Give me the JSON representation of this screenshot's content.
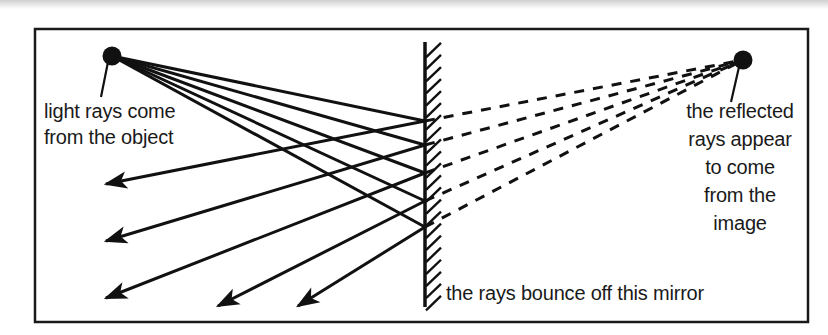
{
  "figure": {
    "frame": {
      "x": 35,
      "y": 29,
      "width": 773,
      "height": 293,
      "stroke": "#1a1a1a",
      "stroke_width": 2.5
    },
    "page_edge_band": {
      "visible": true,
      "height": 7,
      "color": "#d2d2d2"
    },
    "ink_color": "#111111",
    "background": "#ffffff"
  },
  "mirror": {
    "label": "the rays bounce off this mirror",
    "x": 425,
    "y_top": 42,
    "y_bottom": 307,
    "stroke_width": 3.5,
    "hatch_side": "right",
    "hatch_count": 22,
    "hatch_length": 16,
    "label_pos": {
      "x": 446,
      "y": 300
    }
  },
  "object": {
    "label": "light rays come\nfrom the object",
    "label_lines": [
      "light rays come",
      "from the object"
    ],
    "dot": {
      "cx": 112,
      "cy": 56,
      "r": 9.5
    },
    "leader": {
      "x1": 108,
      "y1": 62,
      "x2": 101,
      "y2": 97
    },
    "label_pos": {
      "x": 44,
      "y": 118
    },
    "label_anchor": "start",
    "line_height": 26
  },
  "image": {
    "label": "the reflected\nrays appear\nto come\nfrom the\nimage",
    "label_lines": [
      "the reflected",
      "rays appear",
      "to come",
      "from the",
      "image"
    ],
    "dot": {
      "cx": 743,
      "cy": 60,
      "r": 9.5
    },
    "leader": {
      "x1": 739,
      "y1": 67,
      "x2": 731,
      "y2": 102
    },
    "label_pos": {
      "x": 740,
      "y": 118
    },
    "label_anchor": "middle",
    "line_height": 28
  },
  "chart_data": {
    "type": "diagram",
    "object_point": {
      "x": 112,
      "y": 56
    },
    "image_point": {
      "x": 743,
      "y": 60
    },
    "mirror_x": 425,
    "incident_rays": [
      {
        "from": [
          112,
          56
        ],
        "to": [
          425,
          121
        ]
      },
      {
        "from": [
          112,
          56
        ],
        "to": [
          425,
          145
        ]
      },
      {
        "from": [
          112,
          56
        ],
        "to": [
          425,
          173
        ]
      },
      {
        "from": [
          112,
          56
        ],
        "to": [
          425,
          201
        ]
      },
      {
        "from": [
          112,
          56
        ],
        "to": [
          425,
          227
        ]
      }
    ],
    "reflected_rays": [
      {
        "from": [
          425,
          121
        ],
        "to": [
          106,
          184
        ],
        "arrow": true
      },
      {
        "from": [
          425,
          145
        ],
        "to": [
          106,
          241
        ],
        "arrow": true
      },
      {
        "from": [
          425,
          173
        ],
        "to": [
          106,
          298
        ],
        "arrow": true
      },
      {
        "from": [
          425,
          201
        ],
        "to": [
          218,
          306
        ],
        "arrow": true
      },
      {
        "from": [
          425,
          227
        ],
        "to": [
          298,
          306
        ],
        "arrow": true
      }
    ],
    "virtual_rays_dashed": [
      {
        "from": [
          425,
          121
        ],
        "to": [
          743,
          60
        ]
      },
      {
        "from": [
          425,
          145
        ],
        "to": [
          743,
          60
        ]
      },
      {
        "from": [
          425,
          173
        ],
        "to": [
          743,
          60
        ]
      },
      {
        "from": [
          425,
          201
        ],
        "to": [
          743,
          60
        ]
      },
      {
        "from": [
          425,
          227
        ],
        "to": [
          743,
          60
        ]
      }
    ],
    "annotations": [
      {
        "text": "light rays come from the object",
        "at": [
          44,
          118
        ]
      },
      {
        "text": "the reflected rays appear to come from the image",
        "at": [
          740,
          118
        ]
      },
      {
        "text": "the rays bounce off this mirror",
        "at": [
          446,
          300
        ]
      }
    ],
    "dash_pattern": "10 9",
    "stroke_width": 3,
    "legend": null,
    "grid": false
  }
}
